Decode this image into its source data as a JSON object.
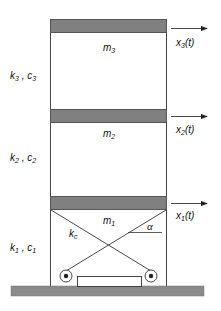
{
  "diagram": {
    "title": "",
    "type": "three-story shear frame with cross-braced first floor",
    "colors": {
      "slab": "#808080",
      "slab_border": "#555555",
      "ground": "#8a8a8a",
      "line": "#333333",
      "text": "#111111"
    },
    "floors": [
      {
        "mass": "m",
        "mass_sub": "3",
        "disp": "x",
        "disp_sub": "3",
        "disp_tail": "(t)",
        "stiff": "k",
        "stiff_sub": "3",
        "damp": "c",
        "damp_sub": "3",
        "sep": " , "
      },
      {
        "mass": "m",
        "mass_sub": "2",
        "disp": "x",
        "disp_sub": "2",
        "disp_tail": "(t)",
        "stiff": "k",
        "stiff_sub": "2",
        "damp": "c",
        "damp_sub": "2",
        "sep": " , "
      },
      {
        "mass": "m",
        "mass_sub": "1",
        "disp": "x",
        "disp_sub": "1",
        "disp_tail": "(t)",
        "stiff": "k",
        "stiff_sub": "1",
        "damp": "c",
        "damp_sub": "1",
        "sep": " , "
      }
    ],
    "brace": {
      "stiff": "k",
      "stiff_sub": "c",
      "angle": "α"
    }
  }
}
